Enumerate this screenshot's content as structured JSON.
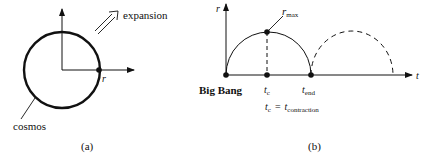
{
  "panel_a": {
    "caption": "(a)",
    "expansion_label": "expansion",
    "radius_label": "r",
    "cosmos_label": "cosmos"
  },
  "panel_b": {
    "caption": "(b)",
    "y_axis_label": "r",
    "x_axis_label": "t",
    "rmax_label_main": "r",
    "rmax_label_sub": "max",
    "big_bang_label": "Big Bang",
    "tc_main": "t",
    "tc_sub": "c",
    "tend_main": "t",
    "tend_sub": "end",
    "eq_lhs_main": "t",
    "eq_lhs_sub": "c",
    "eq_sign": "=",
    "eq_rhs_main": "t",
    "eq_rhs_sub": "contraction"
  },
  "colors": {
    "ink": "#111111",
    "background": "#ffffff"
  }
}
